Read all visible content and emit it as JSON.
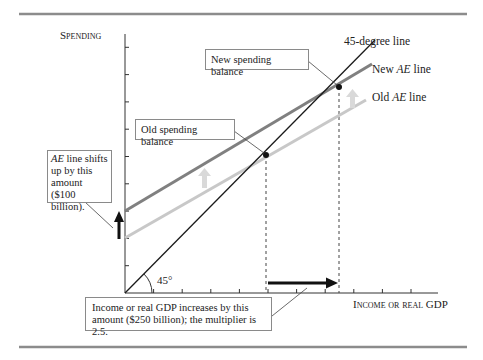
{
  "figure": {
    "y_axis_label": "Spending",
    "x_axis_label_prefix": "Income or real",
    "x_axis_label_suffix": "GDP",
    "angle_label": "45°",
    "line_45_label": "45-degree line",
    "new_ae_label_prefix": "New",
    "new_ae_label_italic": "AE",
    "new_ae_label_suffix": "line",
    "old_ae_label_prefix": "Old",
    "old_ae_label_italic": "AE",
    "old_ae_label_suffix": "line",
    "callouts": {
      "new_balance": "New spending balance",
      "old_balance": "Old spending balance",
      "shift_italic": "AE",
      "shift_rest": " line shifts up by this amount ($100 billion).",
      "gdp_increase": "Income or real GDP increases by this amount ($250 billion); the multiplier is 2.5."
    },
    "colors": {
      "line_45": "#1a1a1a",
      "new_ae": "#808080",
      "old_ae": "#c8c8c8",
      "shift_arrow": "#d9d9d9",
      "rule": "#8c8c8c"
    }
  },
  "chart_data": {
    "type": "line",
    "title": "",
    "xlabel": "Income or real GDP",
    "ylabel": "Spending",
    "x_ticks": 10,
    "y_ticks": 9,
    "grid": false,
    "series": [
      {
        "name": "45-degree line",
        "points": [
          [
            0,
            0
          ],
          [
            8.5,
            8.5
          ]
        ]
      },
      {
        "name": "New AE line",
        "points": [
          [
            0,
            3
          ],
          [
            8.8,
            8.0
          ]
        ]
      },
      {
        "name": "Old AE line",
        "points": [
          [
            0,
            2
          ],
          [
            8.6,
            6.9
          ]
        ]
      }
    ],
    "equilibria": [
      {
        "name": "Old spending balance",
        "x": 5.0,
        "y": 5.0
      },
      {
        "name": "New spending balance",
        "x": 7.5,
        "y": 7.5
      }
    ],
    "annotations": {
      "ae_shift": "$100 billion",
      "gdp_increase": "$250 billion",
      "multiplier": 2.5
    }
  }
}
